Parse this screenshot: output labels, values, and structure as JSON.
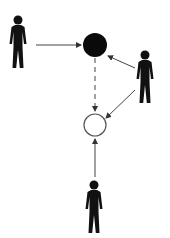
{
  "diagram": {
    "type": "actor-flow",
    "background": "#ffffff",
    "colors": {
      "figure": "#111111",
      "filled_node": "#0a0a0a",
      "hollow_node_stroke": "#555555",
      "arrow": "#444444"
    },
    "actors": [
      {
        "id": "actor-left",
        "x": 18,
        "y": 20
      },
      {
        "id": "actor-right",
        "x": 145,
        "y": 55
      },
      {
        "id": "actor-bottom",
        "x": 94,
        "y": 185
      }
    ],
    "nodes": [
      {
        "id": "node-filled",
        "cx": 95,
        "cy": 45,
        "r": 12,
        "filled": true
      },
      {
        "id": "node-hollow",
        "cx": 95,
        "cy": 125,
        "r": 11,
        "filled": false
      }
    ],
    "edges": [
      {
        "from": "actor-left",
        "to": "node-filled",
        "style": "solid"
      },
      {
        "from": "actor-right",
        "to": "node-filled",
        "style": "solid"
      },
      {
        "from": "actor-right",
        "to": "node-hollow",
        "style": "solid"
      },
      {
        "from": "node-filled",
        "to": "node-hollow",
        "style": "dashed"
      },
      {
        "from": "actor-bottom",
        "to": "node-hollow",
        "style": "solid"
      }
    ]
  }
}
